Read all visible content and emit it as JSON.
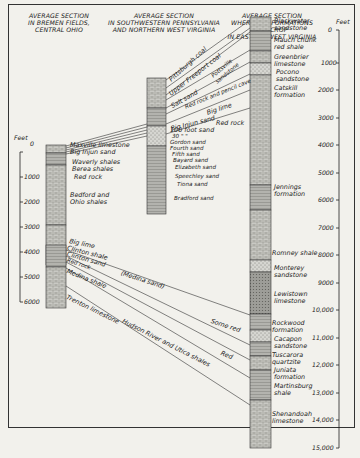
{
  "headers": {
    "ohio": [
      "AVERAGE SECTION",
      "IN BREMEN FIELDS,",
      "CENTRAL OHIO"
    ],
    "penn": [
      "AVERAGE SECTION",
      "IN SOUTHWESTERN PENNSYLVANIA",
      "AND NORTHERN WEST VIRGINIA"
    ],
    "wv": [
      "AVERAGE SECTION",
      "WHERE THE FORMATIONS OUTCROP",
      "IN EASTERN WEST VIRGINIA"
    ]
  },
  "left_scale": {
    "unit": "Feet",
    "ticks": [
      "0",
      "1000",
      "2000",
      "3000",
      "4000",
      "5000",
      "6000"
    ]
  },
  "right_scale": {
    "unit": "Feet",
    "ticks": [
      "0",
      "1000",
      "2000",
      "3000",
      "4000",
      "5000",
      "6000",
      "7000",
      "8000",
      "9000",
      "10,000",
      "11,000",
      "12,000",
      "13,000",
      "14,000",
      "15,000"
    ]
  },
  "ohio_labels": {
    "maxville": "Maxville limestone",
    "big_injun": "Big Injun sand",
    "waverly": "Waverly shales",
    "berea": "Berea shales",
    "red_rock": "Red rock",
    "bedford_1": "Bedford and",
    "bedford_2": "Ohio shales",
    "big_lime": "Big lime",
    "clinton_shale": "Clinton shale",
    "clinton_sand": "Clinton sand",
    "red_rock_2": "Red rock",
    "medina_shale": "Medina shale",
    "trenton": "Trenton limestone"
  },
  "penn_labels": {
    "pittsburgh": "Pittsburgh coal",
    "upper_freeport": "Upper Freeport coal",
    "salt_sand": "Salt sand",
    "pottsville_1": "Pottsville",
    "pottsville_2": "sandstone",
    "red_rock_pencil": "Red rock and pencil cave",
    "big_lime": "Big lime",
    "big_injun": "Big Injun sand",
    "red_rock": "Red rock",
    "hundred_foot": "100 foot sand",
    "thirty_foot": "30  \"       \"",
    "gordon": "Gordon sand",
    "fourth": "Fourth sand",
    "fifth": "Fifth sand",
    "bayard": "Bayard sand",
    "elizabeth": "Elizabeth sand",
    "speechley": "Speechley sand",
    "tiona": "Tiona sand",
    "bradford": "Bradford sand"
  },
  "cross_labels": {
    "medina_sand": "(Medina sand)",
    "some_red": "Some red",
    "red": "Red",
    "hudson": "Hudson River and Utica shales"
  },
  "wv_labels": [
    [
      "Blackwater",
      "sandstone"
    ],
    [
      "Mauch chunk",
      "red shale"
    ],
    [
      "Greenbrier",
      "limestone"
    ],
    [
      "Pocono",
      "sandstone"
    ],
    [
      "Catskill",
      "formation"
    ],
    [
      "Jennings",
      "formation"
    ],
    [
      "Romney shale"
    ],
    [
      "Monterey",
      "sandstone"
    ],
    [
      "Lewistown",
      "limestone"
    ],
    [
      "Rockwood",
      "formation"
    ],
    [
      "Cacapon",
      "sandstone"
    ],
    [
      "Tuscarora",
      "quartzite"
    ],
    [
      "Juniata",
      "formation"
    ],
    [
      "Martinsburg",
      "shale"
    ],
    [
      "Shenandoah",
      "limestone"
    ]
  ],
  "colors": {
    "ink": "#222222",
    "paper": "#f2f1ec",
    "column_fill": "#bdbdb8",
    "column_dark": "#8f8f8a"
  }
}
